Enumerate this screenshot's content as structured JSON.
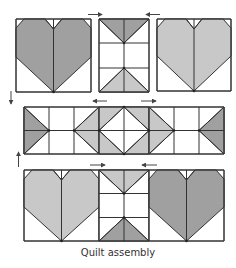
{
  "caption": "Quilt assembly",
  "colors": {
    "dark_fabric": "#a0a0a0",
    "light_fabric": "#c8c8c8",
    "background": "#ffffff",
    "outline": "#333333",
    "arrow": "#444444"
  },
  "rows": [
    {
      "name": "top-row",
      "blocks": [
        {
          "type": "heart",
          "shade": "dark"
        },
        {
          "type": "hourglass-sashing",
          "top_shade": "dark",
          "bottom_shade": "light"
        },
        {
          "type": "heart",
          "shade": "light"
        }
      ],
      "pressing_arrows": [
        "right",
        "left"
      ]
    },
    {
      "name": "middle-row",
      "blocks": [
        {
          "type": "flying-geese-strip",
          "cells": 8
        }
      ],
      "pressing_arrows": [
        "left",
        "right"
      ]
    },
    {
      "name": "bottom-row",
      "blocks": [
        {
          "type": "heart",
          "shade": "light"
        },
        {
          "type": "hourglass-sashing",
          "top_shade": "light",
          "bottom_shade": "dark"
        },
        {
          "type": "heart",
          "shade": "dark"
        }
      ],
      "pressing_arrows": [
        "right",
        "left"
      ]
    }
  ],
  "row_arrows": [
    "down",
    "up"
  ]
}
